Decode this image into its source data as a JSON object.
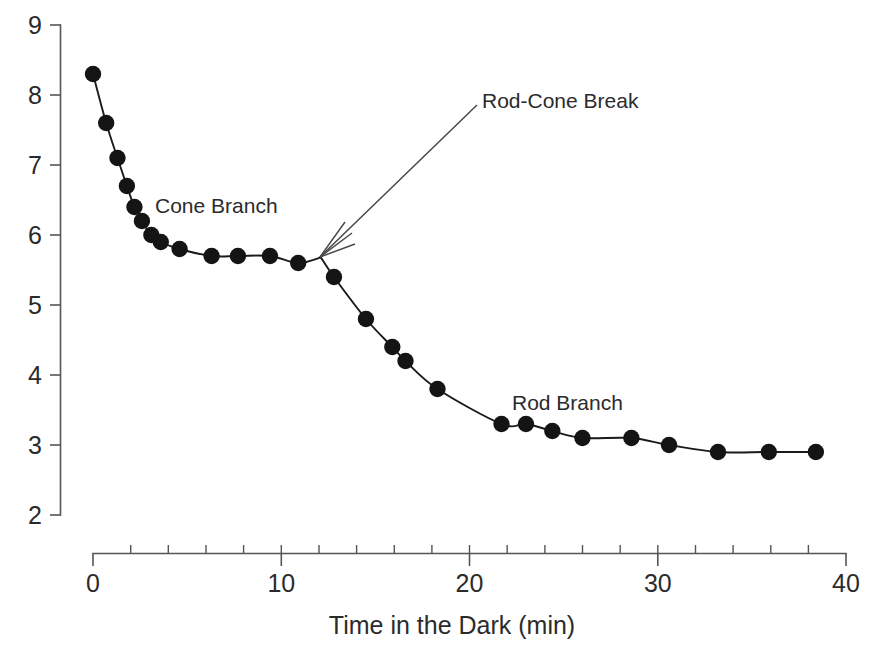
{
  "chart_data": {
    "type": "scatter",
    "title": "",
    "subtitle": "",
    "xlabel": "Time in the Dark (min)",
    "ylabel": "",
    "xlim": [
      0,
      40
    ],
    "ylim": [
      2,
      9
    ],
    "x_ticks": [
      0,
      10,
      20,
      30,
      40
    ],
    "x_tick_labels": [
      "0",
      "10",
      "20",
      "30",
      "40"
    ],
    "x_minor_tick_step": 2,
    "y_ticks": [
      2,
      3,
      4,
      5,
      6,
      7,
      8,
      9
    ],
    "y_tick_labels": [
      "2",
      "3",
      "4",
      "5",
      "6",
      "7",
      "8",
      "9"
    ],
    "grid": false,
    "legend": "none",
    "marker_style": "filled-circle",
    "marker_color": "#141414",
    "line_color": "#1a1a1a",
    "series": [
      {
        "name": "Cone Branch",
        "points": [
          {
            "x": 0.0,
            "y": 8.3
          },
          {
            "x": 0.7,
            "y": 7.6
          },
          {
            "x": 1.3,
            "y": 7.1
          },
          {
            "x": 1.8,
            "y": 6.7
          },
          {
            "x": 2.2,
            "y": 6.4
          },
          {
            "x": 2.6,
            "y": 6.2
          },
          {
            "x": 3.1,
            "y": 6.0
          },
          {
            "x": 3.6,
            "y": 5.9
          },
          {
            "x": 4.6,
            "y": 5.8
          },
          {
            "x": 6.3,
            "y": 5.7
          },
          {
            "x": 7.7,
            "y": 5.7
          },
          {
            "x": 9.4,
            "y": 5.7
          },
          {
            "x": 10.9,
            "y": 5.6
          }
        ]
      },
      {
        "name": "Rod Branch",
        "points": [
          {
            "x": 12.8,
            "y": 5.4
          },
          {
            "x": 14.5,
            "y": 4.8
          },
          {
            "x": 15.9,
            "y": 4.4
          },
          {
            "x": 16.6,
            "y": 4.2
          },
          {
            "x": 18.3,
            "y": 3.8
          },
          {
            "x": 21.7,
            "y": 3.3
          },
          {
            "x": 23.0,
            "y": 3.3
          },
          {
            "x": 24.4,
            "y": 3.2
          },
          {
            "x": 26.0,
            "y": 3.1
          },
          {
            "x": 28.6,
            "y": 3.1
          },
          {
            "x": 30.6,
            "y": 3.0
          },
          {
            "x": 33.2,
            "y": 2.9
          },
          {
            "x": 35.9,
            "y": 2.9
          },
          {
            "x": 38.4,
            "y": 2.9
          }
        ]
      }
    ],
    "annotations": [
      {
        "name": "cone-branch-label",
        "text": "Cone Branch",
        "x": 3.0,
        "y": 6.45
      },
      {
        "name": "rod-branch-label",
        "text": "Rod Branch",
        "x": 22.3,
        "y": 3.78
      },
      {
        "name": "rod-cone-break-label",
        "text": "Rod-Cone Break",
        "x": 21.2,
        "y": 7.85,
        "arrow_to": {
          "x": 12.1,
          "y": 5.68
        }
      }
    ],
    "break_point": {
      "x": 12.1,
      "y": 5.68
    }
  },
  "axis": {
    "x_title": "Time in the Dark (min)"
  }
}
